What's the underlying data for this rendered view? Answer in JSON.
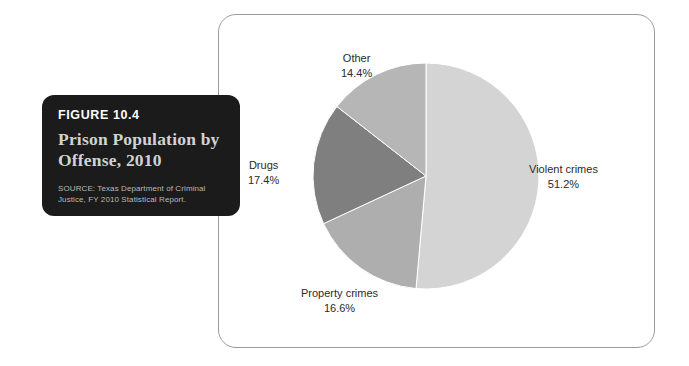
{
  "caption": {
    "figure_number": "FIGURE 10.4",
    "title": "Prison Population by Offense, 2010",
    "source": "SOURCE: Texas Department of Criminal Justice, FY 2010 Statistical Report."
  },
  "chart_data": {
    "type": "pie",
    "title": "Prison Population by Offense, 2010",
    "xlabel": "",
    "ylabel": "",
    "legend": "none",
    "grid": false,
    "categories": [
      "Violent crimes",
      "Property crimes",
      "Drugs",
      "Other"
    ],
    "values": [
      51.2,
      16.6,
      17.4,
      14.4
    ],
    "value_labels": [
      "51.2%",
      "16.6%",
      "17.4%",
      "14.4%"
    ],
    "colors": [
      "#d4d4d4",
      "#aeaeae",
      "#7f7f7f",
      "#b6b6b6"
    ],
    "start_angle_deg": 0,
    "direction": "clockwise",
    "slices": [
      {
        "name": "Violent crimes",
        "value": 51.2,
        "label": "Violent crimes",
        "value_label": "51.2%",
        "color": "#d4d4d4"
      },
      {
        "name": "Property crimes",
        "value": 16.6,
        "label": "Property crimes",
        "value_label": "16.6%",
        "color": "#aeaeae"
      },
      {
        "name": "Drugs",
        "value": 17.4,
        "label": "Drugs",
        "value_label": "17.4%",
        "color": "#7f7f7f"
      },
      {
        "name": "Other",
        "value": 14.4,
        "label": "Other",
        "value_label": "14.4%",
        "color": "#b6b6b6"
      }
    ]
  }
}
